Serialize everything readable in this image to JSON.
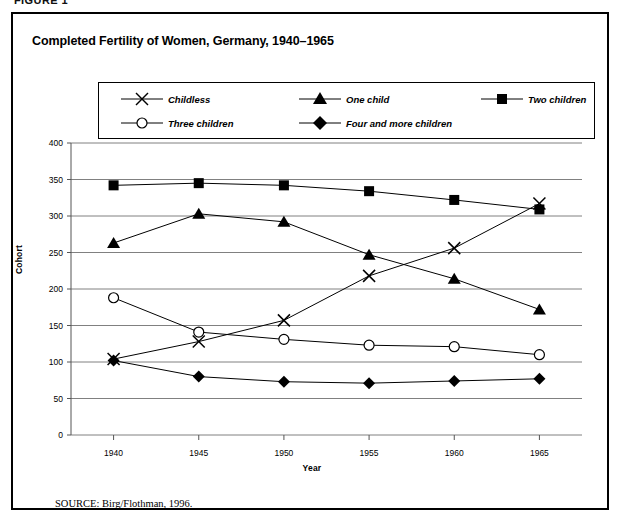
{
  "figure_label": "FIGURE 1",
  "chart_title": "Completed Fertility of Women, Germany, 1940–1965",
  "source": {
    "keyword": "SOURCE:",
    "text": "Birg/Flothman, 1996."
  },
  "legend": {
    "entries": [
      {
        "label": "Childless",
        "marker": "x-marker",
        "row": 0,
        "col": 0
      },
      {
        "label": "One child",
        "marker": "triangle-marker",
        "row": 0,
        "col": 1
      },
      {
        "label": "Two children",
        "marker": "square-marker",
        "row": 0,
        "col": 2
      },
      {
        "label": "Three children",
        "marker": "circle-marker",
        "row": 1,
        "col": 0
      },
      {
        "label": "Four and more children",
        "marker": "diamond-marker",
        "row": 1,
        "col": 1
      }
    ]
  },
  "chart_data": {
    "type": "line",
    "title": "Completed Fertility of Women, Germany, 1940–1965",
    "xlabel": "Year",
    "ylabel": "Cohort",
    "x": [
      1940,
      1945,
      1950,
      1955,
      1960,
      1965
    ],
    "xtick_labels": [
      "1940",
      "1945",
      "1950",
      "1955",
      "1960",
      "1965"
    ],
    "ytick_labels": [
      "0",
      "50",
      "100",
      "150",
      "200",
      "250",
      "300",
      "350",
      "400"
    ],
    "yticks": [
      0,
      50,
      100,
      150,
      200,
      250,
      300,
      350,
      400
    ],
    "ylim": [
      0,
      400
    ],
    "xlim": [
      1937.5,
      1967.5
    ],
    "grid": "horizontal",
    "legend_position": "top",
    "series": [
      {
        "name": "Childless",
        "marker": "x",
        "values": [
          104,
          128,
          157,
          218,
          256,
          317
        ]
      },
      {
        "name": "One child",
        "marker": "triangle",
        "values": [
          263,
          303,
          292,
          247,
          214,
          172
        ]
      },
      {
        "name": "Two children",
        "marker": "square",
        "values": [
          342,
          345,
          342,
          334,
          322,
          309
        ]
      },
      {
        "name": "Three children",
        "marker": "circle",
        "values": [
          188,
          141,
          131,
          123,
          121,
          110
        ]
      },
      {
        "name": "Four and more children",
        "marker": "diamond",
        "values": [
          102,
          80,
          73,
          71,
          74,
          77
        ]
      }
    ]
  }
}
